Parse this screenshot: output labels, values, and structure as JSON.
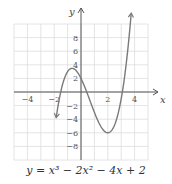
{
  "chart_data": {
    "type": "line",
    "title": "",
    "caption": "y = x³ − 2x² − 4x + 2",
    "xlabel": "x",
    "ylabel": "y",
    "xlim": [
      -5,
      5
    ],
    "ylim": [
      -10,
      10
    ],
    "grid": true,
    "x_ticks": [
      -4,
      -2,
      2,
      4
    ],
    "y_ticks": [
      -8,
      -6,
      -4,
      -2,
      2,
      4,
      6,
      8
    ],
    "series": [
      {
        "name": "y = x^3 - 2x^2 - 4x + 2",
        "expression": "x^3 - 2x^2 - 4x + 2",
        "x": [
          -1.85,
          -1.5,
          -1,
          -0.67,
          -0.5,
          0,
          0.5,
          1,
          1.5,
          2,
          2.5,
          3,
          3.5,
          3.75
        ],
        "values": [
          -9.9,
          -3.875,
          3,
          3.48,
          3.375,
          2,
          -0.375,
          -3,
          -4.625,
          -6,
          -5.125,
          -1,
          5.875,
          11.1
        ]
      }
    ],
    "color": "#7a7a7a",
    "grid_color": "#dddddd",
    "axis_color": "#555555"
  },
  "labels": {
    "x_axis": "x",
    "y_axis": "y",
    "equation_prefix": "y = x",
    "equation": "y = x³ − 2x² − 4x + 2",
    "x_tick_labels": [
      "−4",
      "−2",
      "2",
      "4"
    ],
    "y_tick_labels": [
      "8",
      "6",
      "4",
      "2",
      "−2",
      "−4",
      "−6",
      "−8"
    ]
  }
}
